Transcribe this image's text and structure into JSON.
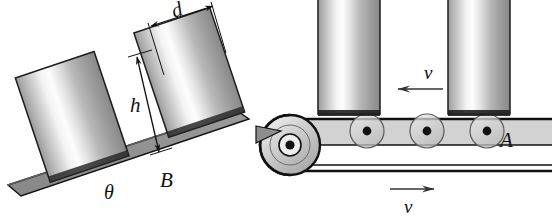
{
  "figure": {
    "background_color": "#ffffff",
    "width": 552,
    "height": 224
  },
  "labels": {
    "diameter": "d",
    "height": "h",
    "angle": "θ",
    "incline": "B",
    "roller": "A",
    "velocity_top": "v",
    "velocity_bottom": "v"
  },
  "colors": {
    "outline": "#111111",
    "ramp_fill": "#8f8f8f",
    "ramp_top": "#6e6e6e",
    "belt_fill": "#d2d2d2",
    "roller_fill": "#cfcfcf",
    "pulley_fill": "#c9c9c9",
    "cylinder_light": "#fbfbfb",
    "cylinder_dark": "#7e7e7e",
    "shadow": "#1a1a1a"
  },
  "incline": {
    "angle_label": "θ",
    "surface_label": "B",
    "cylinder_count": 2,
    "dimension_lines": [
      "d",
      "h"
    ]
  },
  "conveyor": {
    "cylinder_count": 2,
    "roller_count": 4,
    "labeled_roller": "A",
    "belt_top_direction": "left",
    "belt_return_direction": "right",
    "pulley_position": "left"
  }
}
